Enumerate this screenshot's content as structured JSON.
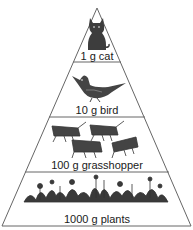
{
  "diagram": {
    "type": "energy-pyramid",
    "levels": [
      {
        "label": "1 g cat",
        "organism": "cat",
        "mass_g": 1
      },
      {
        "label": "10 g bird",
        "organism": "bird",
        "mass_g": 10
      },
      {
        "label": "100 g grasshopper",
        "organism": "grasshopper",
        "mass_g": 100
      },
      {
        "label": "1000 g plants",
        "organism": "plants",
        "mass_g": 1000
      }
    ],
    "colors": {
      "outline": "#555555",
      "figure": "#3a3a3a",
      "background": "#ffffff"
    }
  }
}
